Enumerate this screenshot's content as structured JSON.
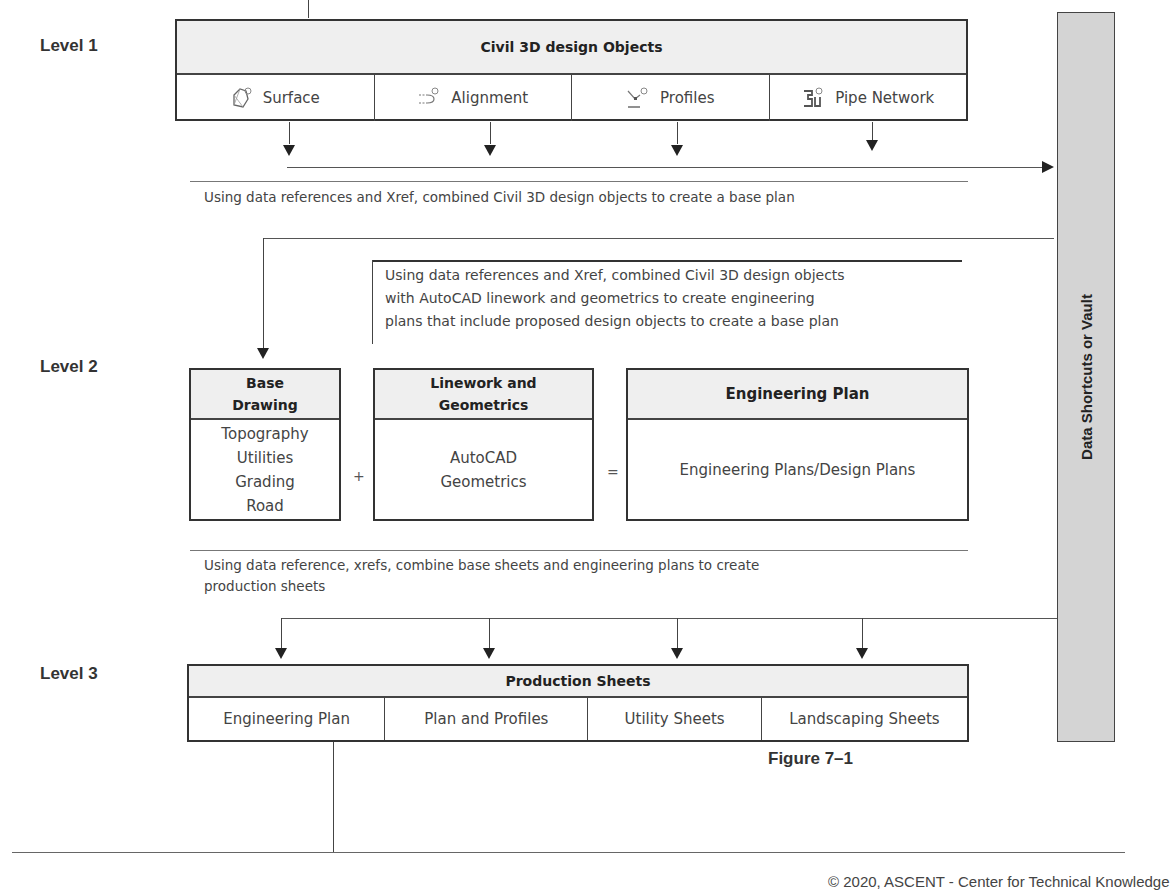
{
  "levels": {
    "level1": {
      "label": "Level 1",
      "box_title": "Civil 3D design Objects",
      "objects": [
        {
          "label": "Surface",
          "icon": "surface-icon"
        },
        {
          "label": "Alignment",
          "icon": "alignment-icon"
        },
        {
          "label": "Profiles",
          "icon": "profiles-icon"
        },
        {
          "label": "Pipe Network",
          "icon": "pipe-network-icon"
        }
      ],
      "caption": "Using data references and Xref, combined Civil 3D design objects to create a base plan"
    },
    "level2": {
      "label": "Level 2",
      "intro": [
        "Using data references and Xref, combined Civil 3D design objects",
        "with AutoCAD linework and geometrics to create engineering",
        "plans that include proposed design objects to create a base plan"
      ],
      "base_drawing": {
        "title_line1": "Base",
        "title_line2": "Drawing",
        "items": [
          "Topography",
          "Utilities",
          "Grading",
          "Road"
        ]
      },
      "plus": "+",
      "linework": {
        "title_line1": "Linework and",
        "title_line2": "Geometrics",
        "body_line1": "AutoCAD",
        "body_line2": "Geometrics"
      },
      "equals": "=",
      "engineering_plan": {
        "title": "Engineering Plan",
        "body": "Engineering Plans/Design Plans"
      },
      "caption_line1": "Using data reference, xrefs, combine base sheets and engineering plans to create",
      "caption_line2": "production sheets"
    },
    "level3": {
      "label": "Level 3",
      "box_title": "Production Sheets",
      "sheets": [
        "Engineering Plan",
        "Plan and Profiles",
        "Utility Sheets",
        "Landscaping Sheets"
      ]
    }
  },
  "vault": {
    "label": "Data Shortcuts or Vault",
    "fill_color": "#d4d4d4"
  },
  "figure_caption": "Figure 7–1",
  "footer": {
    "text": "© 2020, ASCENT - Center for Technical Knowledge"
  }
}
